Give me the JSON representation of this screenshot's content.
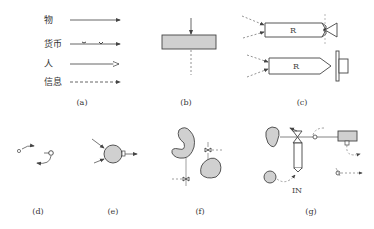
{
  "figure": {
    "legend": {
      "items": [
        {
          "label": "物",
          "line": "solid-filled-arrow"
        },
        {
          "label": "货币",
          "line": "solid-with-bow-marks"
        },
        {
          "label": "人",
          "line": "solid-open-arrow"
        },
        {
          "label": "信息",
          "line": "dashed-filled-arrow"
        }
      ]
    },
    "panels": [
      {
        "id": "a",
        "caption": "(a)"
      },
      {
        "id": "b",
        "caption": "(b)"
      },
      {
        "id": "c",
        "caption": "(c)",
        "boxes": [
          "R",
          "R"
        ]
      },
      {
        "id": "d",
        "caption": "(d)"
      },
      {
        "id": "e",
        "caption": "(e)"
      },
      {
        "id": "f",
        "caption": "(f)"
      },
      {
        "id": "g",
        "caption": "(g)",
        "label": "IN"
      }
    ],
    "colors": {
      "line": "#555555",
      "fill": "#d0d0d0",
      "stroke": "#444444"
    }
  }
}
